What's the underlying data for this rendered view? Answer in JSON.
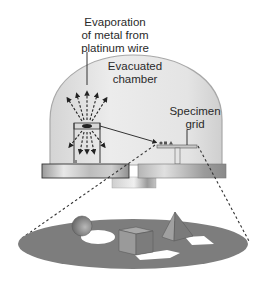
{
  "diagram": {
    "labels": {
      "evaporation": [
        "Evaporation",
        "of metal from",
        "platinum wire"
      ],
      "chamber": [
        "Evacuated",
        "chamber"
      ],
      "specimen": [
        "Specimen",
        "grid"
      ]
    },
    "components": [
      "bell-jar-dome",
      "platinum-wire-source",
      "evaporating-metal-arrows",
      "base-plate",
      "specimen-grid",
      "specimen-stage",
      "magnified-specimen-disc",
      "sphere",
      "cube",
      "pyramid",
      "metal-shadows"
    ],
    "colors": {
      "dome_fill": "#e6e6e6",
      "dome_edge": "#a8a8a8",
      "base_plate": "#bdbdbd",
      "disc": "#7d7d7d",
      "shapes": "#8a8a8a",
      "shadow": "#ffffff",
      "text": "#2a2a2a"
    }
  }
}
